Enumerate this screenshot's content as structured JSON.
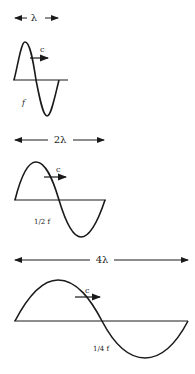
{
  "diagram": {
    "color": "#1a1a1a",
    "panels": [
      {
        "wavelength_label": "λ",
        "speed_label": "c",
        "frequency_label": "f"
      },
      {
        "wavelength_label": "2λ",
        "speed_label": "c",
        "frequency_label": "1/2 f"
      },
      {
        "wavelength_label": "4λ",
        "speed_label": "c",
        "frequency_label": "1/4 f"
      }
    ]
  }
}
